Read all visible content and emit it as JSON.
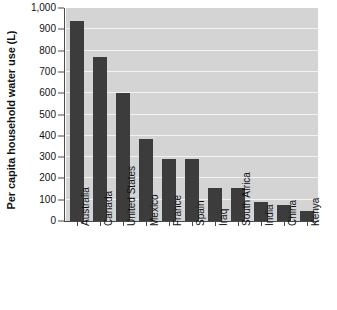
{
  "chart_data": {
    "type": "bar",
    "title": "",
    "subtitle": "",
    "xlabel": "",
    "ylabel": "Per capita household water use (L)",
    "categories": [
      "Australia",
      "Canada",
      "United States",
      "Mexico",
      "France",
      "Spain",
      "Iraq",
      "South Africa",
      "India",
      "China",
      "Kenya"
    ],
    "values": [
      940,
      770,
      600,
      385,
      290,
      290,
      155,
      155,
      90,
      75,
      45
    ],
    "ylim": [
      0,
      1000
    ],
    "ytick_labels": [
      "0",
      "100",
      "200",
      "300",
      "400",
      "500",
      "600",
      "700",
      "800",
      "900",
      "1,000"
    ],
    "ytick_values": [
      0,
      100,
      200,
      300,
      400,
      500,
      600,
      700,
      800,
      900,
      1000
    ],
    "grid": true,
    "grid_axis": "y",
    "legend": false,
    "legend_position": "none",
    "bar_color": "#3c3c3c",
    "plot_background_color": "#d4d4d4",
    "gridline_color": "#f2f2f2",
    "axis_color": "#4a4a4a",
    "figure_background_color": "#ffffff"
  }
}
